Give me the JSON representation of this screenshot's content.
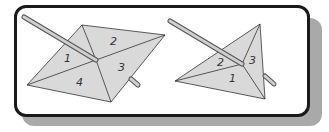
{
  "figure": {
    "title": "",
    "left_pyramid": {
      "face_labels": [
        "1",
        "2",
        "3",
        "4"
      ]
    },
    "right_pyramid": {
      "face_labels": [
        "2",
        "3",
        "1"
      ]
    },
    "colors": {
      "face": "#d9d9d9",
      "outline": "#333333",
      "frame": "#1a1a1a",
      "shadow": "#a9a9a9"
    }
  }
}
